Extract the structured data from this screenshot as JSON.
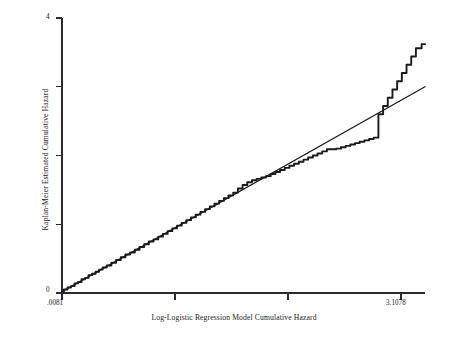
{
  "chart_data": {
    "type": "line",
    "title": "",
    "xlabel": "Log-Logistic Regression Model Cumulative Hazard",
    "ylabel": "Kaplan-Meier Estimated Cumulative Hazard",
    "xlim": [
      0.0081,
      3.1078
    ],
    "ylim": [
      0,
      4
    ],
    "grid": false,
    "legend": "none",
    "xticklabels": [
      ".0081",
      "",
      "",
      "3.1078"
    ],
    "xtick_values": [
      0.0081,
      1.0413,
      2.0745,
      3.1078
    ],
    "yticklabels": [
      "0",
      "",
      "",
      "",
      "4"
    ],
    "ytick_values": [
      0,
      1,
      2,
      3,
      4
    ],
    "series": [
      {
        "name": "Reference line (y = x)",
        "style": "straight-line",
        "x": [
          0.0081,
          3.1078
        ],
        "y": [
          0.02,
          3.0
        ]
      },
      {
        "name": "Kaplan-Meier estimated cumulative hazard",
        "style": "step-curve",
        "x": [
          0.0081,
          0.04,
          0.07,
          0.1,
          0.13,
          0.16,
          0.19,
          0.22,
          0.25,
          0.28,
          0.31,
          0.34,
          0.37,
          0.41,
          0.45,
          0.49,
          0.53,
          0.57,
          0.61,
          0.65,
          0.69,
          0.73,
          0.77,
          0.81,
          0.85,
          0.89,
          0.93,
          0.97,
          1.01,
          1.05,
          1.09,
          1.13,
          1.17,
          1.21,
          1.25,
          1.29,
          1.33,
          1.37,
          1.41,
          1.45,
          1.49,
          1.53,
          1.57,
          1.61,
          1.65,
          1.69,
          1.73,
          1.77,
          1.81,
          1.85,
          1.89,
          1.93,
          1.97,
          2.01,
          2.05,
          2.09,
          2.13,
          2.17,
          2.21,
          2.25,
          2.29,
          2.33,
          2.37,
          2.41,
          2.45,
          2.49,
          2.53,
          2.57,
          2.61,
          2.65,
          2.69,
          2.73,
          2.77,
          2.81,
          2.85,
          2.89,
          2.93,
          2.97,
          3.01,
          3.05,
          3.1078
        ],
        "y": [
          0.02,
          0.05,
          0.08,
          0.1,
          0.14,
          0.16,
          0.2,
          0.22,
          0.26,
          0.28,
          0.31,
          0.34,
          0.37,
          0.4,
          0.44,
          0.48,
          0.52,
          0.56,
          0.59,
          0.63,
          0.67,
          0.71,
          0.75,
          0.78,
          0.82,
          0.86,
          0.9,
          0.94,
          0.98,
          1.02,
          1.06,
          1.1,
          1.14,
          1.18,
          1.22,
          1.26,
          1.3,
          1.34,
          1.38,
          1.42,
          1.46,
          1.52,
          1.57,
          1.61,
          1.64,
          1.66,
          1.68,
          1.7,
          1.73,
          1.76,
          1.79,
          1.82,
          1.85,
          1.88,
          1.91,
          1.94,
          1.97,
          2.0,
          2.03,
          2.06,
          2.09,
          2.09,
          2.1,
          2.12,
          2.14,
          2.16,
          2.18,
          2.2,
          2.22,
          2.24,
          2.26,
          2.6,
          2.72,
          2.84,
          2.96,
          3.08,
          3.2,
          3.32,
          3.44,
          3.56,
          3.62
        ],
        "jump": {
          "at_x": 2.73,
          "from_y": 2.26,
          "to_y": 2.6,
          "description": "sharp vertical rise in Kaplan-Meier curve"
        }
      }
    ]
  }
}
